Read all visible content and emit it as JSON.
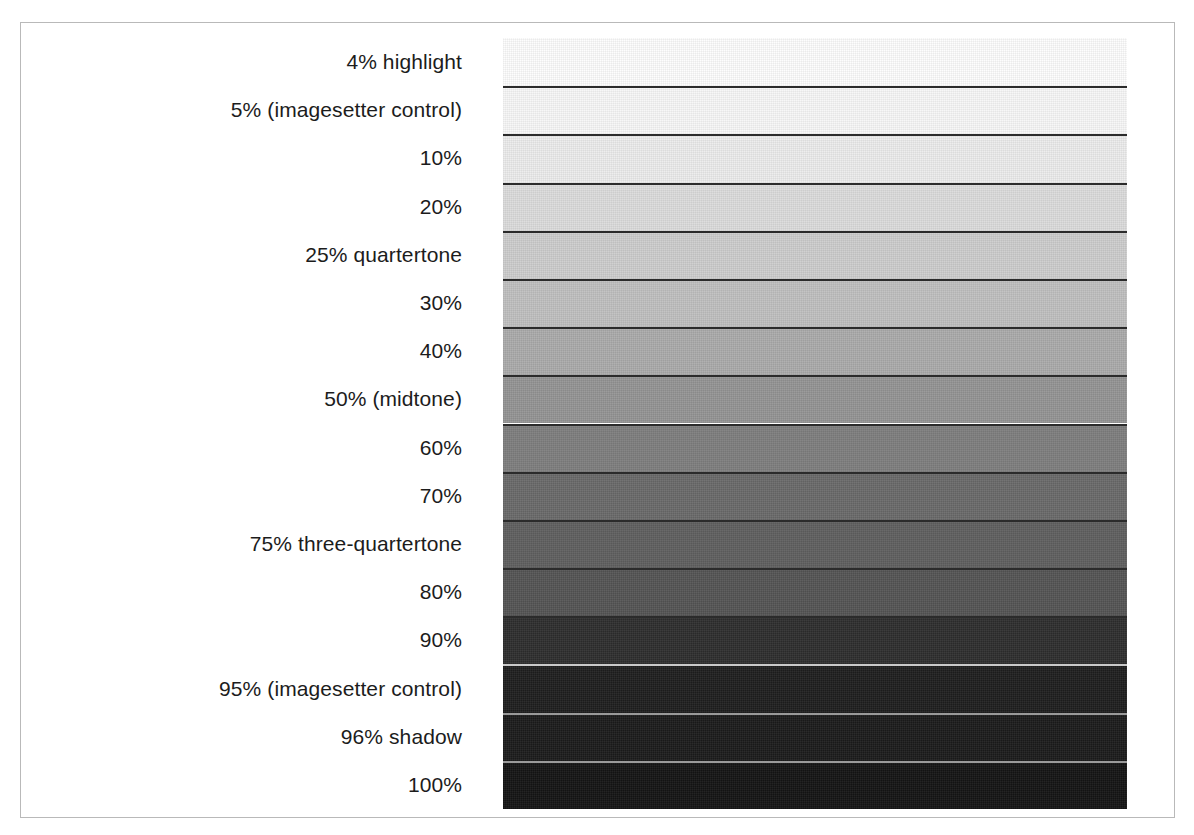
{
  "figure": {
    "kind": "tone-scale-reference-strip",
    "frame": {
      "border_color": "#b9b9b9"
    },
    "label_color": "#1c1c1c",
    "background": "#ffffff"
  },
  "chart_data": {
    "type": "bar",
    "title": "",
    "subtitle": "",
    "xlabel": "",
    "ylabel": "",
    "orientation": "horizontal-bands",
    "grid": false,
    "legend": "none",
    "axis_note": "Each horizontal band is one ink tint percentage; labels are right-aligned beside its band.",
    "categories": [
      "4% highlight",
      "5% (imagesetter control)",
      "10%",
      "20%",
      "25% quartertone",
      "30%",
      "40%",
      "50% (midtone)",
      "60%",
      "70%",
      "75% three-quartertone",
      "80%",
      "90%",
      "95% (imagesetter control)",
      "96% shadow",
      "100%"
    ],
    "values": [
      4,
      5,
      10,
      20,
      25,
      30,
      40,
      50,
      60,
      70,
      75,
      80,
      90,
      95,
      96,
      100
    ],
    "ylim": [
      0,
      100
    ],
    "swatch_colors": [
      "#fdfdfd",
      "#f7f7f7",
      "#ececec",
      "#dcdcdc",
      "#cdcdcd",
      "#c0c0c0",
      "#ababab",
      "#949494",
      "#7e7e7e",
      "#6a6a6a",
      "#5f5f5f",
      "#545454",
      "#2e2e2e",
      "#1e1e1e",
      "#1b1b1b",
      "#141414"
    ],
    "separator_colors": [
      "#2b2b2b",
      "#2b2b2b",
      "#2b2b2b",
      "#2b2b2b",
      "#2b2b2b",
      "#2b2b2b",
      "#2b2b2b",
      "#2b2b2b",
      "#2b2b2b",
      "#2b2b2b",
      "#2b2b2b",
      "#2b2b2b",
      "#c9c9c9",
      "#9a9a9a",
      "#9a9a9a",
      "#9a9a9a"
    ]
  },
  "rows": [
    {
      "label": "4% highlight",
      "percent": 4,
      "color": "#fdfdfd",
      "rule": "none"
    },
    {
      "label": "5% (imagesetter control)",
      "percent": 5,
      "color": "#f7f7f7",
      "rule": "dark"
    },
    {
      "label": "10%",
      "percent": 10,
      "color": "#ececec",
      "rule": "dark"
    },
    {
      "label": "20%",
      "percent": 20,
      "color": "#dcdcdc",
      "rule": "dark"
    },
    {
      "label": "25% quartertone",
      "percent": 25,
      "color": "#cdcdcd",
      "rule": "dark"
    },
    {
      "label": "30%",
      "percent": 30,
      "color": "#c0c0c0",
      "rule": "dark"
    },
    {
      "label": "40%",
      "percent": 40,
      "color": "#ababab",
      "rule": "dark"
    },
    {
      "label": "50% (midtone)",
      "percent": 50,
      "color": "#949494",
      "rule": "dark"
    },
    {
      "label": "60%",
      "percent": 60,
      "color": "#7e7e7e",
      "rule": "dark"
    },
    {
      "label": "70%",
      "percent": 70,
      "color": "#6a6a6a",
      "rule": "dark"
    },
    {
      "label": "75% three-quartertone",
      "percent": 75,
      "color": "#5f5f5f",
      "rule": "dark"
    },
    {
      "label": "80%",
      "percent": 80,
      "color": "#545454",
      "rule": "dark"
    },
    {
      "label": "90%",
      "percent": 90,
      "color": "#2e2e2e",
      "rule": "dark"
    },
    {
      "label": "95% (imagesetter control)",
      "percent": 95,
      "color": "#1e1e1e",
      "rule": "light"
    },
    {
      "label": "96% shadow",
      "percent": 96,
      "color": "#1b1b1b",
      "rule": "light"
    },
    {
      "label": "100%",
      "percent": 100,
      "color": "#141414",
      "rule": "light"
    }
  ]
}
